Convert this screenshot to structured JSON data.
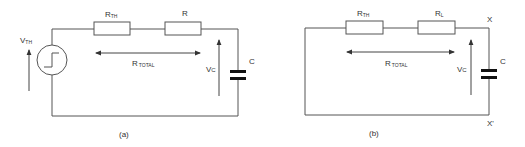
{
  "colors": {
    "wire": "#555555",
    "text": "#333333",
    "capacitor": "#111111",
    "background": "#ffffff"
  },
  "circuit_a": {
    "caption": "(a)",
    "source_label_main": "V",
    "source_label_sub": "TH",
    "r1_label_main": "R",
    "r1_label_sub": "TH",
    "r2_label": "R",
    "rtotal_main": "R",
    "rtotal_sub": "TOTAL",
    "vc_main": "V",
    "vc_sub": "C",
    "cap_label": "C"
  },
  "circuit_b": {
    "caption": "(b)",
    "r1_label_main": "R",
    "r1_label_sub": "TH",
    "r2_label_main": "R",
    "r2_label_sub": "L",
    "rtotal_main": "R",
    "rtotal_sub": "TOTAL",
    "vc_main": "V",
    "vc_sub": "C",
    "cap_label": "C",
    "terminal_top": "X",
    "terminal_bottom": "X'"
  }
}
